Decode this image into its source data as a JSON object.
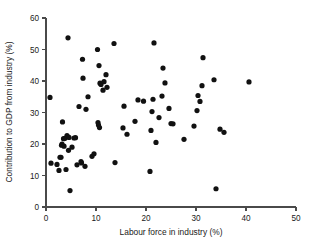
{
  "chart_data": {
    "type": "scatter",
    "title": "",
    "xlabel": "Labour force in industry (%)",
    "ylabel": "Contribution to GDP from industry (%)",
    "xlim": [
      0,
      50
    ],
    "ylim": [
      0,
      60
    ],
    "xticks": [
      0,
      10,
      20,
      30,
      40,
      50
    ],
    "yticks": [
      0,
      10,
      20,
      30,
      40,
      50,
      60
    ],
    "grid": false,
    "legend": null,
    "marker": {
      "shape": "circle",
      "color": "#111111",
      "size": 2.6
    },
    "points": [
      [
        0.8,
        34.8
      ],
      [
        1.0,
        13.9
      ],
      [
        2.2,
        13.5
      ],
      [
        2.6,
        11.6
      ],
      [
        2.8,
        15.8
      ],
      [
        3.0,
        15.8
      ],
      [
        3.1,
        19.6
      ],
      [
        3.2,
        20.0
      ],
      [
        3.3,
        27.0
      ],
      [
        3.5,
        21.7
      ],
      [
        3.6,
        19.3
      ],
      [
        3.8,
        21.8
      ],
      [
        4.0,
        11.9
      ],
      [
        4.2,
        22.7
      ],
      [
        4.4,
        53.7
      ],
      [
        4.5,
        18.0
      ],
      [
        4.6,
        22.1
      ],
      [
        4.8,
        5.2
      ],
      [
        5.2,
        19.0
      ],
      [
        5.6,
        21.9
      ],
      [
        5.9,
        22.0
      ],
      [
        6.2,
        13.4
      ],
      [
        6.6,
        31.9
      ],
      [
        7.0,
        14.4
      ],
      [
        7.1,
        14.0
      ],
      [
        7.3,
        46.9
      ],
      [
        7.4,
        40.9
      ],
      [
        7.8,
        12.9
      ],
      [
        8.0,
        31.0
      ],
      [
        8.4,
        35.0
      ],
      [
        9.2,
        16.1
      ],
      [
        9.6,
        16.9
      ],
      [
        10.3,
        50.0
      ],
      [
        10.4,
        26.8
      ],
      [
        10.5,
        26.0
      ],
      [
        10.6,
        44.9
      ],
      [
        10.7,
        25.2
      ],
      [
        10.8,
        39.3
      ],
      [
        11.0,
        38.9
      ],
      [
        11.4,
        37.1
      ],
      [
        11.6,
        39.8
      ],
      [
        12.0,
        42.0
      ],
      [
        12.2,
        38.0
      ],
      [
        13.6,
        51.9
      ],
      [
        13.8,
        14.1
      ],
      [
        15.4,
        25.1
      ],
      [
        15.6,
        32.0
      ],
      [
        16.2,
        23.1
      ],
      [
        17.8,
        27.2
      ],
      [
        18.4,
        34.0
      ],
      [
        19.5,
        33.6
      ],
      [
        20.8,
        11.3
      ],
      [
        21.0,
        24.3
      ],
      [
        21.2,
        30.3
      ],
      [
        21.4,
        34.2
      ],
      [
        21.6,
        52.1
      ],
      [
        22.0,
        20.5
      ],
      [
        22.6,
        28.4
      ],
      [
        23.2,
        35.2
      ],
      [
        23.4,
        44.1
      ],
      [
        23.8,
        39.4
      ],
      [
        24.6,
        31.3
      ],
      [
        25.0,
        26.5
      ],
      [
        25.4,
        26.4
      ],
      [
        27.6,
        21.5
      ],
      [
        29.6,
        25.7
      ],
      [
        30.2,
        30.6
      ],
      [
        30.4,
        35.4
      ],
      [
        30.8,
        33.5
      ],
      [
        31.2,
        38.5
      ],
      [
        31.4,
        47.4
      ],
      [
        33.6,
        40.4
      ],
      [
        34.0,
        5.8
      ],
      [
        34.8,
        24.7
      ],
      [
        35.6,
        23.7
      ],
      [
        40.6,
        39.7
      ]
    ]
  },
  "axes": {
    "x_tick_labels": [
      "0",
      "10",
      "20",
      "30",
      "40",
      "50"
    ],
    "y_tick_labels": [
      "0",
      "10",
      "20",
      "30",
      "40",
      "50",
      "60"
    ]
  }
}
